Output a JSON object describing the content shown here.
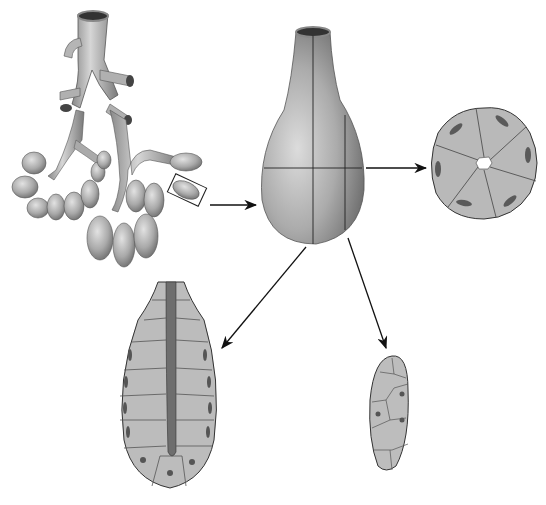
{
  "figure": {
    "type": "anatomical-illustration",
    "panels": [
      {
        "id": "branched-gland",
        "description": "Branching duct tree ending in clustered acini, with one acinus outlined by a selection box"
      },
      {
        "id": "single-acinus",
        "description": "Enlarged single acinus (flask-shaped) with cut planes marked"
      },
      {
        "id": "cross-section",
        "description": "Transverse section of acinus showing ring of wedge-shaped cells around central lumen"
      },
      {
        "id": "longitudinal-section",
        "description": "Longitudinal section showing cells lining a central duct lumen"
      },
      {
        "id": "tangential-section",
        "description": "Tangential section showing a sheet of cells with nuclei"
      }
    ],
    "arrows": [
      {
        "from": "branched-gland",
        "to": "single-acinus"
      },
      {
        "from": "single-acinus",
        "to": "cross-section"
      },
      {
        "from": "single-acinus",
        "to": "longitudinal-section"
      },
      {
        "from": "single-acinus",
        "to": "tangential-section"
      }
    ],
    "colors": {
      "background": "#ffffff",
      "tissue_light": "#c8c8c8",
      "tissue_mid": "#a8a8a8",
      "tissue_dark": "#707070",
      "outline": "#333333",
      "arrow": "#111111"
    }
  }
}
